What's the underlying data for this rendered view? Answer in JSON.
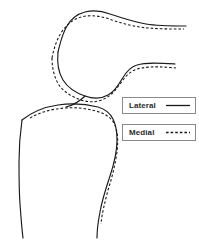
{
  "figure": {
    "name": "knee-joint-contour-overlay",
    "background_color": "#ffffff",
    "width": 199,
    "height": 240
  },
  "legend": {
    "position": "center-right",
    "border_color": "#8a8a8a",
    "entries": [
      {
        "label": "Lateral",
        "line_style": "solid",
        "color": "#1a1a1a",
        "sample_icon": "solid-line-icon"
      },
      {
        "label": "Medial",
        "line_style": "dashed",
        "color": "#1a1a1a",
        "sample_icon": "dashed-line-icon"
      }
    ]
  },
  "chart_data": {
    "type": "line",
    "title": "",
    "subtitle": "",
    "xlabel": "",
    "ylabel": "",
    "grid": false,
    "legend_position": "center-right",
    "series": [
      {
        "name": "Lateral",
        "style": "solid",
        "color": "#1a1a1a",
        "paths": [
          {
            "part": "femur-anterior-and-condyle",
            "d": "M 58 52 C 60 44 62 34 67 26 C 71 19 77 14 85 12 C 93 10 102 11 110 14 C 122 18 134 22 146 24 C 158 26 172 26 186 26"
          },
          {
            "part": "femur-posterior-and-trochlea",
            "d": "M 58 52 C 57 62 58 72 63 80 C 68 88 76 93 85 96 C 93 99 101 99 108 95 C 114 92 118 86 122 79 C 126 72 130 67 137 65 C 146 62 160 63 175 64"
          },
          {
            "part": "tibial-plateau-and-shaft",
            "d": "M 22 120 C 32 112 44 107 58 105 C 72 103 86 104 98 107 C 105 109 110 113 113 119 C 116 125 117 132 117 140 C 117 152 114 164 110 176 C 106 188 102 200 100 212 C 98 222 97 231 97 238"
          },
          {
            "part": "tibia-medial-border",
            "d": "M 22 120 C 20 134 19 148 19 162 C 19 176 19 190 20 204 C 21 218 22 230 23 238"
          },
          {
            "part": "patella-lower-facet",
            "d": "M 85 96 C 80 101 74 105 66 107"
          }
        ]
      },
      {
        "name": "Medial",
        "style": "dashed",
        "color": "#1a1a1a",
        "paths": [
          {
            "part": "femur-anterior-and-condyle",
            "d": "M 52 58 C 54 48 57 38 63 30 C 69 22 77 17 86 16 C 95 15 104 17 112 20 C 124 24 136 27 148 28 C 159 29 172 29 184 29"
          },
          {
            "part": "femur-posterior-and-trochlea",
            "d": "M 52 58 C 52 68 54 77 59 85 C 64 92 72 97 81 100 C 90 103 99 102 106 98 C 113 94 118 87 123 80 C 128 73 134 69 142 68 C 152 66 164 67 176 68"
          },
          {
            "part": "tibial-plateau-and-shaft",
            "d": "M 30 118 C 40 112 52 109 65 108 C 78 107 91 109 102 113 C 109 116 114 121 116 128 C 118 135 118 143 117 152 C 115 165 112 178 108 190 C 105 202 102 213 101 224"
          }
        ]
      }
    ]
  }
}
